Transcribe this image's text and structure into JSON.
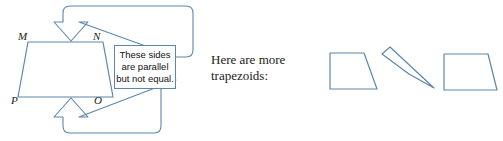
{
  "figure": {
    "colors": {
      "stroke": "#5b87ad",
      "text": "#1b1b1b",
      "callout_text": "#111111",
      "background": "#ffffff"
    }
  },
  "main_trapezoid": {
    "name": "trapezoid-MNOP",
    "labels": {
      "top_left": "M",
      "top_right": "N",
      "bottom_left": "P",
      "bottom_right": "O"
    },
    "points": "28,42 103,42 113,97 18,97"
  },
  "callout": {
    "lines": [
      "These sides",
      "are parallel",
      "but not equal."
    ],
    "line1": "These sides",
    "line2": "are parallel",
    "line3": "but not equal."
  },
  "arrows": [
    {
      "name": "arrow-to-top-side",
      "direction": "down",
      "target_side": "MN",
      "path": "M 176,57 L 186,57 Q 193,57 193,50 L 193,13 Q 193,6 186,6 L 70,6 Q 63,6 63,13 L 63,22 L 54,22 L 71,41 L 88,22 L 79,22 L 79,22 Q 79,22 79,22 L 79,22 Z"
    },
    {
      "name": "arrow-to-bottom-side",
      "direction": "up",
      "target_side": "PO",
      "path": "M 176,80 L 168,80 Q 161,80 161,87 L 161,126 Q 161,133 154,133 L 70,133 Q 63,133 63,126 L 63,117 L 54,117 L 71,98 L 88,117 L 79,117 Z"
    }
  ],
  "right_section": {
    "caption_line1": "Here are more",
    "caption_line2": "trapezoids:",
    "caption_full": "Here are more trapezoids:",
    "shapes": [
      {
        "name": "trapezoid-right-angle",
        "points": "330,53 364,53 377,89 330,89"
      },
      {
        "name": "trapezoid-sliver",
        "points": "382,54 390,47 434,88 409,74"
      },
      {
        "name": "trapezoid-wide",
        "points": "444,54 488,54 497,90 444,90"
      }
    ]
  }
}
